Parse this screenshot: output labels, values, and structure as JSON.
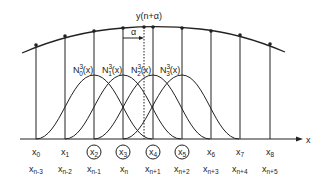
{
  "diagram": {
    "title_point_label": "y(n+α)",
    "alpha_label": "α",
    "axis_label": "x",
    "basis_labels": [
      {
        "base": "N",
        "sup": "3",
        "sub": "0",
        "arg": "(x)"
      },
      {
        "base": "N",
        "sup": "3",
        "sub": "1",
        "arg": "(x)"
      },
      {
        "base": "N",
        "sup": "3",
        "sub": "2",
        "arg": "(x)"
      },
      {
        "base": "N",
        "sup": "3",
        "sub": "3",
        "arg": "(x)"
      }
    ],
    "knots": [
      {
        "top": "x",
        "top_sub": "0",
        "bottom": "x",
        "bottom_sub": "n-3",
        "circled": false
      },
      {
        "top": "x",
        "top_sub": "1",
        "bottom": "x",
        "bottom_sub": "n-2",
        "circled": false
      },
      {
        "top": "x",
        "top_sub": "2",
        "bottom": "x",
        "bottom_sub": "n-1",
        "circled": true
      },
      {
        "top": "x",
        "top_sub": "3",
        "bottom": "x",
        "bottom_sub": "n",
        "circled": true
      },
      {
        "top": "x",
        "top_sub": "4",
        "bottom": "x",
        "bottom_sub": "n+1",
        "circled": true
      },
      {
        "top": "x",
        "top_sub": "5",
        "bottom": "x",
        "bottom_sub": "n+2",
        "circled": true
      },
      {
        "top": "x",
        "top_sub": "6",
        "bottom": "x",
        "bottom_sub": "n+3",
        "circled": false
      },
      {
        "top": "x",
        "top_sub": "7",
        "bottom": "x",
        "bottom_sub": "n+4",
        "circled": false
      },
      {
        "top": "x",
        "top_sub": "8",
        "bottom": "x",
        "bottom_sub": "n+5",
        "circled": false
      }
    ]
  }
}
